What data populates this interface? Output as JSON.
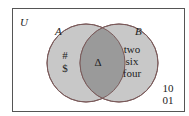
{
  "diagram": {
    "type": "venn",
    "universe_label": "U",
    "sets": [
      {
        "name": "A",
        "only_elements": [
          "#",
          "$"
        ]
      },
      {
        "name": "B",
        "only_elements": [
          "two",
          "six",
          "four"
        ]
      }
    ],
    "intersection_elements": [
      "Δ"
    ],
    "outside_elements": [
      "10",
      "01"
    ],
    "colors": {
      "border": "#555555",
      "circle_fill": "#c8c8c8",
      "intersection_fill": "#9a9a9a",
      "circle_stroke": "#7a5a5a"
    }
  }
}
